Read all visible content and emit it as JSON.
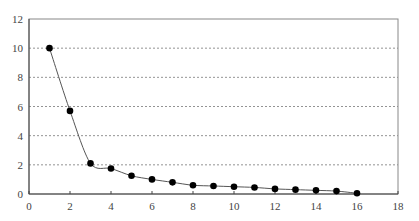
{
  "chart_data": {
    "type": "line",
    "title": "",
    "xlabel": "",
    "ylabel": "",
    "xlim": [
      0,
      18
    ],
    "ylim": [
      0,
      12
    ],
    "xticks": [
      0,
      2,
      4,
      6,
      8,
      10,
      12,
      14,
      16,
      18
    ],
    "yticks": [
      0,
      2,
      4,
      6,
      8,
      10,
      12
    ],
    "grid": {
      "y": true,
      "x": false,
      "style": "dashed",
      "lines": [
        2,
        4,
        6,
        8,
        10
      ]
    },
    "legend": null,
    "series": [
      {
        "name": "series-1",
        "marker": "circle-filled",
        "color": "#000000",
        "line_color": "#555555",
        "x": [
          1,
          2,
          3,
          4,
          5,
          6,
          7,
          8,
          9,
          10,
          11,
          12,
          13,
          14,
          15,
          16
        ],
        "values": [
          10.0,
          5.7,
          2.1,
          1.75,
          1.25,
          1.0,
          0.8,
          0.6,
          0.55,
          0.5,
          0.45,
          0.35,
          0.3,
          0.25,
          0.2,
          0.05
        ]
      }
    ]
  },
  "layout": {
    "plot_left": 29,
    "plot_right": 398,
    "plot_top": 19,
    "plot_bottom": 194
  }
}
